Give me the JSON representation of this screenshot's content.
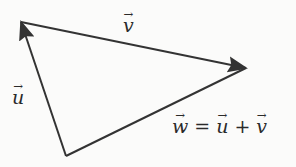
{
  "diagram": {
    "stroke_color": "#333333",
    "background_color": "#fbfbfa",
    "points": {
      "top_left": [
        21,
        22
      ],
      "right": [
        246,
        68
      ],
      "bottom": [
        66,
        156
      ]
    },
    "vectors": [
      {
        "name": "u",
        "from": "bottom",
        "to": "top_left",
        "label": "u"
      },
      {
        "name": "v",
        "from": "top_left",
        "to": "right",
        "label": "v"
      },
      {
        "name": "w",
        "from": "bottom",
        "to": "right",
        "label": "w"
      }
    ],
    "labels": {
      "v": "v",
      "u": "u",
      "equation": {
        "lhs": "w",
        "equals": "=",
        "term1": "u",
        "plus": "+",
        "term2": "v"
      }
    }
  }
}
